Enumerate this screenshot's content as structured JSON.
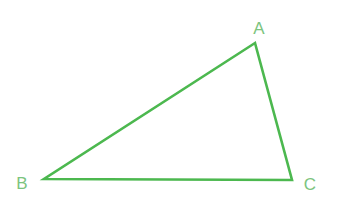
{
  "diagram": {
    "type": "triangle",
    "stroke_color": "#4cb84f",
    "label_color": "#7cc47e",
    "vertices": [
      {
        "name": "A",
        "x": 255,
        "y": 43,
        "label_x": 259,
        "label_y": 34
      },
      {
        "name": "B",
        "x": 44,
        "y": 179,
        "label_x": 22,
        "label_y": 189
      },
      {
        "name": "C",
        "x": 292,
        "y": 180,
        "label_x": 310,
        "label_y": 190
      }
    ],
    "labels": {
      "a": "A",
      "b": "B",
      "c": "C"
    }
  }
}
